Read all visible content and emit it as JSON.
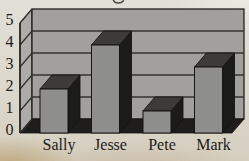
{
  "chart_data": {
    "type": "bar",
    "style": "3d-perspective",
    "title": "",
    "title_fragment": "g",
    "categories": [
      "Sally",
      "Jesse",
      "Pete",
      "Mark"
    ],
    "values": [
      2,
      4,
      1,
      3
    ],
    "xlabel": "",
    "ylabel": "",
    "ylim": [
      0,
      5
    ],
    "yticks": [
      "0",
      "1",
      "2",
      "3",
      "4",
      "5"
    ],
    "grid": true,
    "legend": "none",
    "colors": {
      "back_wall": "#a1a09d",
      "left_wall": "#adaca8",
      "floor": "#1e1d1b",
      "bar_front": "#8e8e8c",
      "bar_top": "#3c3b39",
      "bar_side": "#1b1b1a",
      "gridline": "#34332f",
      "outline": "#161512",
      "text": "#1c1b18",
      "paper": "#dcd8cd",
      "stain": "#ac8a4e"
    }
  }
}
